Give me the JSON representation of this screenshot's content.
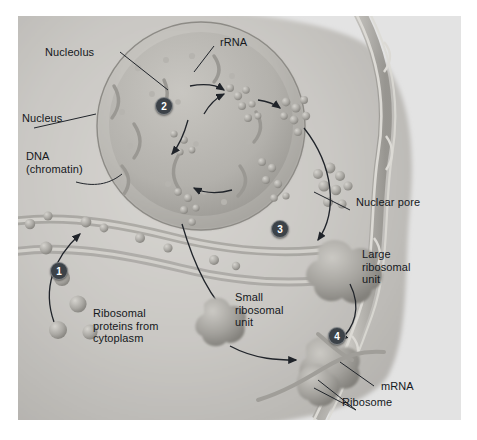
{
  "figure": {
    "panel_bg": "#e3e3e3",
    "ink": "#15181c",
    "step_badge_color": "#3c4248"
  },
  "labels": [
    {
      "name": "nucleolus",
      "text": "Nucleolus",
      "x": 45,
      "y": 46
    },
    {
      "name": "rrna",
      "text": "rRNA",
      "x": 220,
      "y": 36
    },
    {
      "name": "nucleus",
      "text": "Nucleus",
      "x": 22,
      "y": 112
    },
    {
      "name": "dna-chromatin",
      "text": "DNA\n(chromatin)",
      "x": 26,
      "y": 150
    },
    {
      "name": "nuclear-pore",
      "text": "Nuclear pore",
      "x": 356,
      "y": 196
    },
    {
      "name": "large-subunit",
      "text": "Large\nribosomal\nunit",
      "x": 362,
      "y": 248
    },
    {
      "name": "small-subunit",
      "text": "Small\nribosomal\nunit",
      "x": 235,
      "y": 291
    },
    {
      "name": "ribosomal-proteins",
      "text": "Ribosomal\nproteins from\ncytoplasm",
      "x": 93,
      "y": 307
    },
    {
      "name": "mrna",
      "text": "mRNA",
      "x": 381,
      "y": 380
    },
    {
      "name": "ribosome",
      "text": "Ribosome",
      "x": 342,
      "y": 396
    }
  ],
  "steps": [
    {
      "name": "step-1",
      "label": "1",
      "x": 50,
      "y": 262
    },
    {
      "name": "step-2",
      "label": "2",
      "x": 155,
      "y": 97
    },
    {
      "name": "step-3",
      "label": "3",
      "x": 271,
      "y": 220
    },
    {
      "name": "step-4",
      "label": "4",
      "x": 328,
      "y": 327
    }
  ],
  "structures": {
    "nucleus_name": "nucleus-body",
    "nucleolus_name": "nucleolus-body",
    "envelope_name": "nuclear-envelope",
    "large_subunit_name": "large-ribosomal-subunit-shape",
    "small_subunit_name": "small-ribosomal-subunit-shape",
    "ribosome_name": "assembled-ribosome-shape",
    "mrna_name": "mrna-strand",
    "protein_spheres_name": "ribosomal-protein-spheres"
  }
}
